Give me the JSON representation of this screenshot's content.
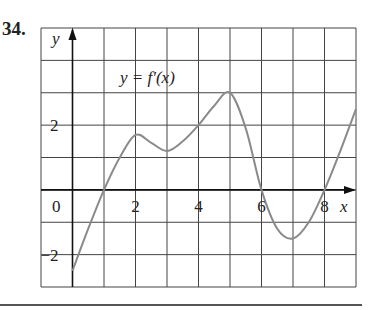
{
  "problem": {
    "number": "34."
  },
  "chart_data": {
    "type": "line",
    "title": "",
    "curve_label": "y = f′(x)",
    "xlabel": "x",
    "ylabel": "y",
    "xlim": [
      -1,
      9
    ],
    "ylim": [
      -3,
      5
    ],
    "grid": true,
    "x_ticks": [
      {
        "value": 2,
        "label": "2"
      },
      {
        "value": 4,
        "label": "4"
      },
      {
        "value": 6,
        "label": "6"
      },
      {
        "value": 8,
        "label": "8"
      }
    ],
    "y_ticks": [
      {
        "value": 2,
        "label": "2"
      },
      {
        "value": -2,
        "label": "−2"
      }
    ],
    "origin_label": "0",
    "series": [
      {
        "name": "f'(x)",
        "x": [
          0,
          0.5,
          1,
          1.5,
          2,
          2.5,
          3,
          3.5,
          4,
          4.5,
          5,
          5.5,
          6,
          6.5,
          7,
          7.5,
          8,
          8.5,
          9
        ],
        "y": [
          -2.5,
          -1.2,
          0,
          1.0,
          1.7,
          1.45,
          1.2,
          1.5,
          2.0,
          2.6,
          3.0,
          1.9,
          0,
          -1.2,
          -1.5,
          -1.0,
          0,
          1.2,
          2.5
        ]
      }
    ],
    "colors": {
      "curve": "#8a8a8a",
      "grid": "#444444",
      "axis": "#111111"
    }
  }
}
